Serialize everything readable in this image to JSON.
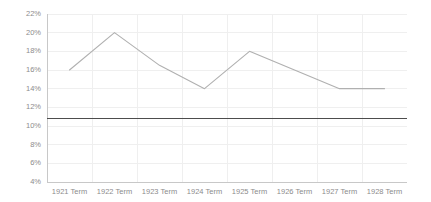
{
  "chart_data": {
    "type": "line",
    "title": "",
    "subtitle": "",
    "xlabel": "",
    "ylabel": "",
    "categories": [
      "1921 Term",
      "1922 Term",
      "1923 Term",
      "1924 Term",
      "1925 Term",
      "1926 Term",
      "1927 Term",
      "1928 Term"
    ],
    "series": [
      {
        "name": "Percentage",
        "color": "#b0b0b0",
        "values": [
          16.0,
          20.0,
          16.5,
          14.0,
          18.0,
          16.0,
          14.0,
          14.0
        ]
      }
    ],
    "reference_lines": [
      {
        "name": "baseline",
        "value": 10.8,
        "color": "#4d4d4d",
        "orientation": "horizontal"
      }
    ],
    "ylim": [
      4,
      22
    ],
    "ytick_step": 2,
    "ytick_labels": [
      "22%",
      "20%",
      "18%",
      "16%",
      "14%",
      "12%",
      "10%",
      "8%",
      "6%",
      "4%"
    ],
    "ytick_values": [
      22,
      20,
      18,
      16,
      14,
      12,
      10,
      8,
      6,
      4
    ],
    "grid": "both-faint",
    "legend": "none",
    "background": "#ffffff"
  }
}
